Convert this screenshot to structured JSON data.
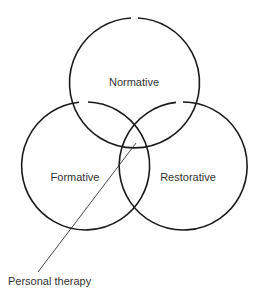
{
  "diagram": {
    "type": "venn",
    "circles": [
      {
        "label": "Normative",
        "cx": 135,
        "cy": 83,
        "r": 65
      },
      {
        "label": "Formative",
        "cx": 85,
        "cy": 166,
        "r": 64
      },
      {
        "label": "Restorative",
        "cx": 180,
        "cy": 166,
        "r": 64
      }
    ],
    "annotation": {
      "label": "Personal therapy"
    },
    "stroke_color": "#1a1a1a"
  }
}
